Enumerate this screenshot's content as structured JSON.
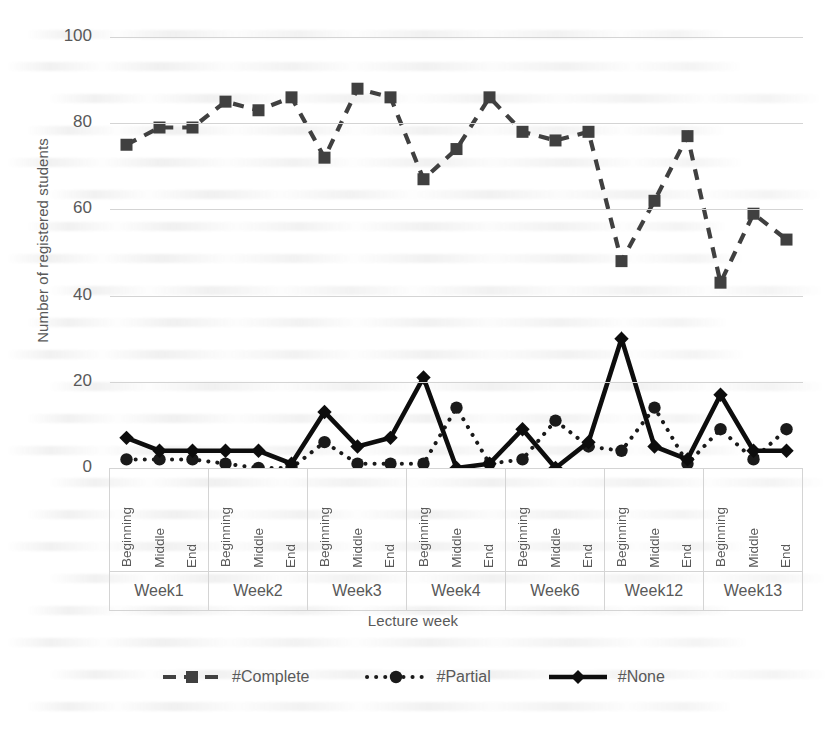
{
  "chart_data": {
    "type": "line",
    "title": "",
    "xlabel": "Lecture week",
    "ylabel": "Number of registered students",
    "ylim": [
      0,
      100
    ],
    "ytick_values": [
      100,
      80,
      60,
      40,
      20,
      0
    ],
    "grid": "horizontal",
    "legend_position": "bottom",
    "groups": [
      "Week1",
      "Week2",
      "Week3",
      "Week4",
      "Week6",
      "Week12",
      "Week13"
    ],
    "subcategories": [
      "Beginning",
      "Middle",
      "End"
    ],
    "categories": [
      "Week1 Beginning",
      "Week1 Middle",
      "Week1 End",
      "Week2 Beginning",
      "Week2 Middle",
      "Week2 End",
      "Week3 Beginning",
      "Week3 Middle",
      "Week3 End",
      "Week4 Beginning",
      "Week4 Middle",
      "Week4 End",
      "Week6 Beginning",
      "Week6 Middle",
      "Week6 End",
      "Week12 Beginning",
      "Week12 Middle",
      "Week12 End",
      "Week13 Beginning",
      "Week13 Middle",
      "Week13 End"
    ],
    "series": [
      {
        "name": "#Complete",
        "marker": "square",
        "line_style": "dashed",
        "color": "#404040",
        "values": [
          75,
          79,
          79,
          85,
          83,
          86,
          72,
          88,
          86,
          67,
          74,
          86,
          78,
          76,
          78,
          48,
          62,
          77,
          43,
          59,
          53
        ]
      },
      {
        "name": "#Partial",
        "marker": "circle",
        "line_style": "dotted",
        "color": "#1a1a1a",
        "values": [
          2,
          2,
          2,
          1,
          0,
          0,
          6,
          1,
          1,
          1,
          14,
          1,
          2,
          11,
          5,
          4,
          14,
          1,
          9,
          2,
          9
        ]
      },
      {
        "name": "#None",
        "marker": "diamond",
        "line_style": "solid",
        "color": "#0d0d0d",
        "values": [
          7,
          4,
          4,
          4,
          4,
          1,
          13,
          5,
          7,
          21,
          0,
          1,
          9,
          0,
          6,
          30,
          5,
          2,
          17,
          4,
          4
        ]
      }
    ]
  },
  "legend": {
    "items": [
      {
        "label": "#Complete",
        "swatch": "dashed-square-marker"
      },
      {
        "label": "#Partial",
        "swatch": "dotted-circle-marker"
      },
      {
        "label": "#None",
        "swatch": "solid-diamond-marker"
      }
    ]
  },
  "axes": {
    "y_title": "Number of registered students",
    "x_title": "Lecture week",
    "y_ticks": [
      "100",
      "80",
      "60",
      "40",
      "20",
      "0"
    ]
  }
}
